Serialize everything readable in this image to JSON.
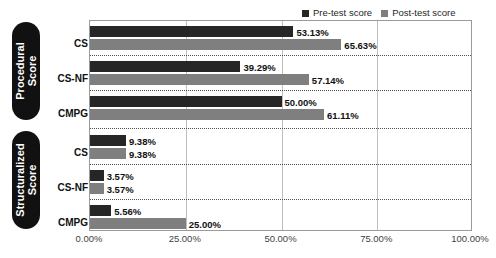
{
  "chart_data": {
    "type": "bar",
    "orientation": "horizontal",
    "title": "",
    "xlabel": "",
    "ylabel": "",
    "xlim": [
      0,
      100
    ],
    "grid": true,
    "legend_position": "top-right",
    "xticks": [
      "0.00%",
      "25.00%",
      "50.00%",
      "75.00%",
      "100.00%"
    ],
    "xtick_values": [
      0,
      25,
      50,
      75,
      100
    ],
    "series": [
      {
        "name": "Pre-test score",
        "color": "#262626"
      },
      {
        "name": "Post-test score",
        "color": "#7f7f7f"
      }
    ],
    "groups": [
      {
        "name": "Procedural Score",
        "categories": [
          "CS",
          "CS-NF",
          "CMPG"
        ],
        "rows": [
          {
            "category": "CS",
            "pre": 53.13,
            "post": 65.63,
            "pre_label": "53.13%",
            "post_label": "65.63%"
          },
          {
            "category": "CS-NF",
            "pre": 39.29,
            "post": 57.14,
            "pre_label": "39.29%",
            "post_label": "57.14%"
          },
          {
            "category": "CMPG",
            "pre": 50.0,
            "post": 61.11,
            "pre_label": "50.00%",
            "post_label": "61.11%"
          }
        ]
      },
      {
        "name": "Structuralized Score",
        "categories": [
          "CS",
          "CS-NF",
          "CMPG"
        ],
        "rows": [
          {
            "category": "CS",
            "pre": 9.38,
            "post": 9.38,
            "pre_label": "9.38%",
            "post_label": "9.38%"
          },
          {
            "category": "CS-NF",
            "pre": 3.57,
            "post": 3.57,
            "pre_label": "3.57%",
            "post_label": "3.57%"
          },
          {
            "category": "CMPG",
            "pre": 5.56,
            "post": 25.0,
            "pre_label": "5.56%",
            "post_label": "25.00%"
          }
        ]
      }
    ]
  },
  "legend": {
    "pre_label": "Pre-test score",
    "post_label": "Post-test score"
  },
  "banners": {
    "procedural_line1": "Procedural",
    "procedural_line2": "Score",
    "structuralized_line1": "Structuralized",
    "structuralized_line2": "Score"
  },
  "categories": {
    "p_cs": "CS",
    "p_csnf": "CS-NF",
    "p_cmpg": "CMPG",
    "s_cs": "CS",
    "s_csnf": "CS-NF",
    "s_cmpg": "CMPG"
  },
  "xaxis": {
    "t0": "0.00%",
    "t1": "25.00%",
    "t2": "50.00%",
    "t3": "75.00%",
    "t4": "100.00%"
  },
  "colors": {
    "pre": "#262626",
    "post": "#7f7f7f",
    "banner": "#111111",
    "grid": "#bfbfbf",
    "border": "#9a9a9a"
  }
}
